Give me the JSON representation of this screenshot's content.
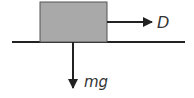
{
  "diagram": {
    "type": "free-body-diagram",
    "colors": {
      "background": "#ffffff",
      "box_fill": "#a9a9a9",
      "box_stroke": "#555555",
      "line": "#222222",
      "label": "#333333"
    },
    "ground": {
      "x1": 12,
      "x2": 185,
      "y": 42
    },
    "box": {
      "x": 40,
      "y": 2,
      "width": 67,
      "height": 40
    },
    "forces": [
      {
        "id": "drive",
        "label": "D",
        "direction": "right",
        "x1": 107,
        "y1": 22,
        "x2": 152,
        "y2": 22,
        "label_x": 157,
        "label_y": 28
      },
      {
        "id": "weight",
        "label": "mg",
        "direction": "down",
        "x1": 73,
        "y1": 42,
        "x2": 73,
        "y2": 88,
        "label_x": 84,
        "label_y": 87
      }
    ]
  }
}
